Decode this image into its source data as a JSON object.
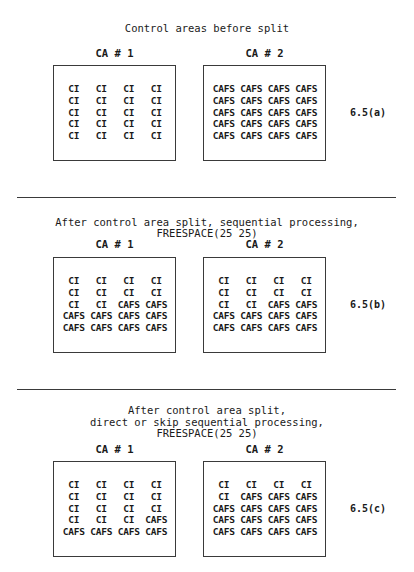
{
  "sections": [
    {
      "id": "a",
      "title_lines": [
        "Control areas before split"
      ],
      "figure_label": "6.5(a)",
      "control_areas": [
        {
          "label": "CA # 1",
          "cells": [
            [
              "CI",
              "CI",
              "CI",
              "CI"
            ],
            [
              "CI",
              "CI",
              "CI",
              "CI"
            ],
            [
              "CI",
              "CI",
              "CI",
              "CI"
            ],
            [
              "CI",
              "CI",
              "CI",
              "CI"
            ],
            [
              "CI",
              "CI",
              "CI",
              "CI"
            ]
          ]
        },
        {
          "label": "CA # 2",
          "cells": [
            [
              "CAFS",
              "CAFS",
              "CAFS",
              "CAFS"
            ],
            [
              "CAFS",
              "CAFS",
              "CAFS",
              "CAFS"
            ],
            [
              "CAFS",
              "CAFS",
              "CAFS",
              "CAFS"
            ],
            [
              "CAFS",
              "CAFS",
              "CAFS",
              "CAFS"
            ],
            [
              "CAFS",
              "CAFS",
              "CAFS",
              "CAFS"
            ]
          ]
        }
      ]
    },
    {
      "id": "b",
      "title_lines": [
        "After control area split, sequential processing,",
        "FREESPACE(25 25)"
      ],
      "figure_label": "6.5(b)",
      "control_areas": [
        {
          "label": "CA # 1",
          "cells": [
            [
              "CI",
              "CI",
              "CI",
              "CI"
            ],
            [
              "CI",
              "CI",
              "CI",
              "CI"
            ],
            [
              "CI",
              "CI",
              "CAFS",
              "CAFS"
            ],
            [
              "CAFS",
              "CAFS",
              "CAFS",
              "CAFS"
            ],
            [
              "CAFS",
              "CAFS",
              "CAFS",
              "CAFS"
            ]
          ]
        },
        {
          "label": "CA # 2",
          "cells": [
            [
              "CI",
              "CI",
              "CI",
              "CI"
            ],
            [
              "CI",
              "CI",
              "CI",
              "CI"
            ],
            [
              "CI",
              "CI",
              "CAFS",
              "CAFS"
            ],
            [
              "CAFS",
              "CAFS",
              "CAFS",
              "CAFS"
            ],
            [
              "CAFS",
              "CAFS",
              "CAFS",
              "CAFS"
            ]
          ]
        }
      ]
    },
    {
      "id": "c",
      "title_lines": [
        "After control area split,",
        "direct or skip sequential processing,",
        "FREESPACE(25 25)"
      ],
      "figure_label": "6.5(c)",
      "control_areas": [
        {
          "label": "CA # 1",
          "cells": [
            [
              "CI",
              "CI",
              "CI",
              "CI"
            ],
            [
              "CI",
              "CI",
              "CI",
              "CI"
            ],
            [
              "CI",
              "CI",
              "CI",
              "CI"
            ],
            [
              "CI",
              "CI",
              "CI",
              "CAFS"
            ],
            [
              "CAFS",
              "CAFS",
              "CAFS",
              "CAFS"
            ]
          ]
        },
        {
          "label": "CA # 2",
          "cells": [
            [
              "CI",
              "CI",
              "CI",
              "CI"
            ],
            [
              "CI",
              "CAFS",
              "CAFS",
              "CAFS"
            ],
            [
              "CAFS",
              "CAFS",
              "CAFS",
              "CAFS"
            ],
            [
              "CAFS",
              "CAFS",
              "CAFS",
              "CAFS"
            ],
            [
              "CAFS",
              "CAFS",
              "CAFS",
              "CAFS"
            ]
          ]
        }
      ]
    }
  ]
}
